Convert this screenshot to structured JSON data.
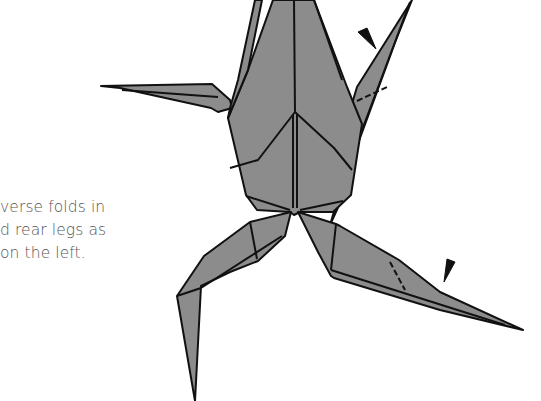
{
  "caption": {
    "lines": [
      "verse folds in",
      "d rear legs as",
      "on the left."
    ]
  },
  "figure": {
    "fill_color": "#8c8c8c",
    "line_color": "#111111",
    "arrow_count": 2
  }
}
